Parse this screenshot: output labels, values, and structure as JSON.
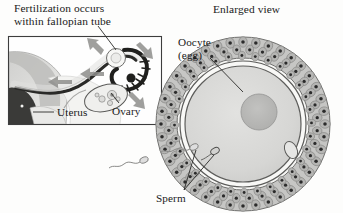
{
  "figure": {
    "type": "biology-illustration",
    "background_color": "#fdfdfc",
    "ink_color": "#1a1a1a"
  },
  "headings": {
    "left_title_line1": "Fertilization occurs",
    "left_title_line2": "within fallopian tube",
    "right_title": "Enlarged view"
  },
  "labels": {
    "oocyte_line1": "Oocyte",
    "oocyte_line2": "(egg)",
    "uterus": "Uterus",
    "ovary": "Ovary",
    "sperm": "Sperm"
  },
  "inset_panel": {
    "name": "fallopian-tube-diagram",
    "frame": {
      "x": 8,
      "y": 36,
      "width": 154,
      "height": 89,
      "border_color": "#3a3a3a"
    },
    "structures": [
      "uterus-body",
      "uterine-cavity",
      "fallopian-tube",
      "fimbriae",
      "fertilization-site",
      "ovary",
      "oocyte-release-path"
    ],
    "arrow_count": 5,
    "arrow_color": "#8e8e8e"
  },
  "enlarged_view": {
    "name": "oocyte-enlarged",
    "center": {
      "x": 243,
      "y": 124
    },
    "corona_radiata_outer_radius": 88,
    "zona_pellucida_radius": 64,
    "oocyte_radius": 59,
    "nucleus": {
      "cx": 260,
      "cy": 112,
      "r": 18
    },
    "polar_body": {
      "cx": 291,
      "cy": 150,
      "rx": 6,
      "ry": 9
    },
    "sperm_inside": {
      "cx": 214,
      "cy": 152
    },
    "corona_cell_layers": 3,
    "colors": {
      "corona_fill": "#b9b9b9",
      "corona_nucleus": "#2b2b2b",
      "cytoplasm": "#d8d8d6",
      "nucleus_fill": "#b4b4b2",
      "zona_fill": "#f4f4f2",
      "outline": "#4a4a4a"
    }
  },
  "free_sperm": [
    {
      "name": "free-sperm-upper",
      "head_x": 193,
      "head_y": 148
    },
    {
      "name": "free-sperm-lower",
      "head_x": 143,
      "head_y": 160
    }
  ],
  "leader_lines": {
    "fertilization_to_site": true,
    "oocyte_to_cytoplasm": true,
    "uterus_to_body": true,
    "ovary_to_ovary": true,
    "sperm_to_free_sperm": true,
    "sperm_to_inner_sperm": true
  }
}
